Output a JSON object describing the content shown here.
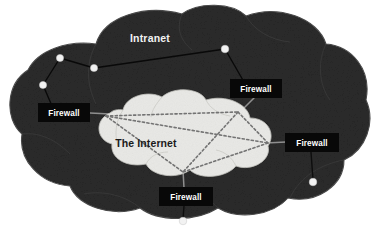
{
  "diagram": {
    "colors": {
      "outer_cloud_fill": "#2b2b2b",
      "outer_cloud_edge": "#4a4a4a",
      "inner_cloud_fill": "#e9e9e6",
      "inner_cloud_edge": "#b9b9b4",
      "label_box_fill": "#0a0a0a",
      "label_text": "#ffffff",
      "node_fill": "#f0f0f0",
      "link_dark": "#0d0d0d",
      "link_light": "#9a9a9a",
      "mesh_dashed": "#6a6a6a",
      "page_background": "#ffffff"
    },
    "clouds": [
      {
        "id": "intranet-cloud",
        "label": "Intranet",
        "label_x": 148,
        "label_y": 42,
        "kind": "outer"
      },
      {
        "id": "internet-cloud",
        "label": "The Internet",
        "label_x": 146,
        "label_y": 147,
        "kind": "inner"
      }
    ],
    "firewalls": [
      {
        "id": "firewall-top-right",
        "label": "Firewall",
        "x": 230,
        "y": 79,
        "w": 52,
        "h": 19
      },
      {
        "id": "firewall-left",
        "label": "Firewall",
        "x": 38,
        "y": 103,
        "w": 52,
        "h": 19
      },
      {
        "id": "firewall-right",
        "label": "Firewall",
        "x": 285,
        "y": 133,
        "w": 54,
        "h": 19
      },
      {
        "id": "firewall-bottom",
        "label": "Firewall",
        "x": 159,
        "y": 187,
        "w": 54,
        "h": 19
      }
    ],
    "nodes": [
      {
        "id": "node-upper-left-a",
        "cx": 60,
        "cy": 58,
        "r": 3.6
      },
      {
        "id": "node-upper-left-b",
        "cx": 94,
        "cy": 68,
        "r": 3.6
      },
      {
        "id": "node-left-lower",
        "cx": 43,
        "cy": 85,
        "r": 3.6
      },
      {
        "id": "node-top-right",
        "cx": 225,
        "cy": 49,
        "r": 3.8
      },
      {
        "id": "node-right-lower",
        "cx": 313,
        "cy": 182,
        "r": 3.8
      },
      {
        "id": "node-bottom",
        "cx": 183,
        "cy": 221,
        "r": 3.8
      }
    ],
    "mesh_vertices": [
      {
        "id": "mesh-west",
        "x": 106,
        "y": 116
      },
      {
        "id": "mesh-north",
        "x": 238,
        "y": 112
      },
      {
        "id": "mesh-east",
        "x": 268,
        "y": 143
      },
      {
        "id": "mesh-south",
        "x": 183,
        "y": 172
      }
    ],
    "links": [
      {
        "id": "link-a-b",
        "from": "node-upper-left-a",
        "to": "node-upper-left-b",
        "style": "solid-dark"
      },
      {
        "id": "link-a-leftlower",
        "from": "node-upper-left-a",
        "to": "node-left-lower",
        "style": "solid-dark"
      },
      {
        "id": "link-b-topright",
        "from": "node-upper-left-b",
        "to": "node-top-right",
        "style": "solid-dark"
      },
      {
        "id": "link-topright-fw",
        "from": "node-top-right",
        "to": "firewall-top-right",
        "style": "solid-dark"
      },
      {
        "id": "link-fw-mesh-north",
        "from": "firewall-top-right",
        "to": "mesh-north",
        "style": "solid-light"
      },
      {
        "id": "link-leftlower-fw",
        "from": "node-left-lower",
        "to": "firewall-left",
        "style": "solid-dark"
      },
      {
        "id": "link-fwleft-mesh",
        "from": "firewall-left",
        "to": "mesh-west",
        "style": "solid-light"
      },
      {
        "id": "link-mesh-east-fw",
        "from": "mesh-east",
        "to": "firewall-right",
        "style": "solid-light"
      },
      {
        "id": "link-fwright-node",
        "from": "firewall-right",
        "to": "node-right-lower",
        "style": "solid-dark"
      },
      {
        "id": "link-mesh-south-fw",
        "from": "mesh-south",
        "to": "firewall-bottom",
        "style": "solid-light"
      },
      {
        "id": "link-fwbottom-node",
        "from": "firewall-bottom",
        "to": "node-bottom",
        "style": "solid-dark"
      }
    ],
    "mesh_links": [
      {
        "id": "mesh-west-north",
        "from": "mesh-west",
        "to": "mesh-north"
      },
      {
        "id": "mesh-west-east",
        "from": "mesh-west",
        "to": "mesh-east"
      },
      {
        "id": "mesh-west-south",
        "from": "mesh-west",
        "to": "mesh-south"
      },
      {
        "id": "mesh-north-east",
        "from": "mesh-north",
        "to": "mesh-east"
      },
      {
        "id": "mesh-north-south",
        "from": "mesh-north",
        "to": "mesh-south"
      },
      {
        "id": "mesh-east-south",
        "from": "mesh-east",
        "to": "mesh-south"
      }
    ]
  }
}
